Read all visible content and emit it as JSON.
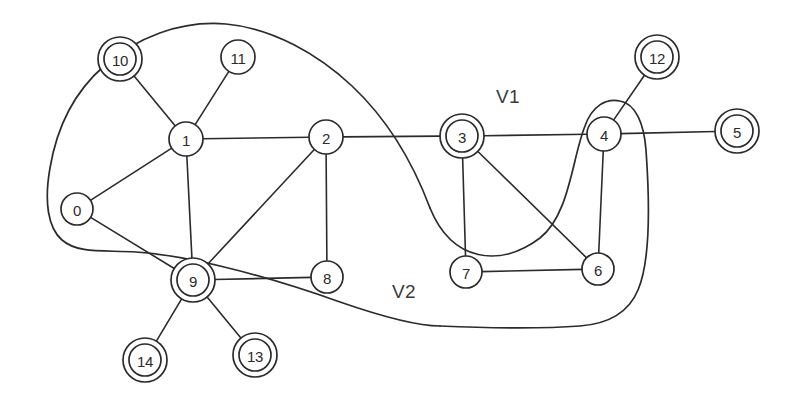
{
  "diagram": {
    "width": 793,
    "height": 408,
    "background": "#ffffff",
    "stroke_color": "#2b2b2b"
  },
  "nodes": [
    {
      "id": "0",
      "label": "0",
      "cx": 77,
      "cy": 209,
      "r": 16,
      "double": false
    },
    {
      "id": "1",
      "label": "1",
      "cx": 186,
      "cy": 139,
      "r": 17,
      "double": false
    },
    {
      "id": "2",
      "label": "2",
      "cx": 326,
      "cy": 137,
      "r": 17,
      "double": false
    },
    {
      "id": "3",
      "label": "3",
      "cx": 462,
      "cy": 136,
      "r": 16,
      "double": true
    },
    {
      "id": "4",
      "label": "4",
      "cx": 604,
      "cy": 134,
      "r": 17,
      "double": false
    },
    {
      "id": "5",
      "label": "5",
      "cx": 737,
      "cy": 131,
      "r": 16,
      "double": true
    },
    {
      "id": "6",
      "label": "6",
      "cx": 598,
      "cy": 269,
      "r": 16,
      "double": false
    },
    {
      "id": "7",
      "label": "7",
      "cx": 466,
      "cy": 272,
      "r": 16,
      "double": false
    },
    {
      "id": "8",
      "label": "8",
      "cx": 327,
      "cy": 277,
      "r": 16,
      "double": false
    },
    {
      "id": "9",
      "label": "9",
      "cx": 193,
      "cy": 280,
      "r": 16,
      "double": true
    },
    {
      "id": "10",
      "label": "10",
      "cx": 120,
      "cy": 59,
      "r": 16,
      "double": true
    },
    {
      "id": "11",
      "label": "11",
      "cx": 238,
      "cy": 57,
      "r": 17,
      "double": false
    },
    {
      "id": "12",
      "label": "12",
      "cx": 657,
      "cy": 57,
      "r": 16,
      "double": true
    },
    {
      "id": "13",
      "label": "13",
      "cx": 255,
      "cy": 355,
      "r": 16,
      "double": true
    },
    {
      "id": "14",
      "label": "14",
      "cx": 145,
      "cy": 360,
      "r": 16,
      "double": true
    }
  ],
  "edges": [
    {
      "from": "10",
      "to": "1"
    },
    {
      "from": "11",
      "to": "1"
    },
    {
      "from": "1",
      "to": "0"
    },
    {
      "from": "1",
      "to": "2"
    },
    {
      "from": "1",
      "to": "9"
    },
    {
      "from": "0",
      "to": "9"
    },
    {
      "from": "2",
      "to": "8"
    },
    {
      "from": "2",
      "to": "9"
    },
    {
      "from": "2",
      "to": "3"
    },
    {
      "from": "8",
      "to": "9"
    },
    {
      "from": "9",
      "to": "14"
    },
    {
      "from": "9",
      "to": "13"
    },
    {
      "from": "3",
      "to": "4"
    },
    {
      "from": "3",
      "to": "7"
    },
    {
      "from": "3",
      "to": "6"
    },
    {
      "from": "4",
      "to": "5"
    },
    {
      "from": "4",
      "to": "12"
    },
    {
      "from": "4",
      "to": "6"
    },
    {
      "from": "7",
      "to": "6"
    }
  ],
  "regions": [
    {
      "id": "V1",
      "label": "V1",
      "label_x": 508,
      "label_y": 96,
      "members": [
        "3",
        "4",
        "6",
        "7"
      ]
    },
    {
      "id": "V2",
      "label": "V2",
      "label_x": 404,
      "label_y": 291,
      "members": [
        "0",
        "1",
        "2",
        "8",
        "9"
      ]
    }
  ],
  "region_paths": {
    "V1": "M 430 208 C 452 262 500 268 540 238 C 570 214 572 158 585 126 C 592 106 606 98 620 101 C 636 104 644 124 646 150 C 650 206 650 262 638 290 C 628 314 606 324 580 326 C 540 329 486 328 440 326",
    "V2": "M 430 208 C 412 160 386 118 352 86 C 318 54 272 28 226 24 C 180 20 136 38 104 66 C 72 94 56 132 50 168 C 44 202 48 228 62 240 C 78 254 104 250 136 252 C 196 256 278 280 340 302 C 392 320 424 326 440 326"
  }
}
